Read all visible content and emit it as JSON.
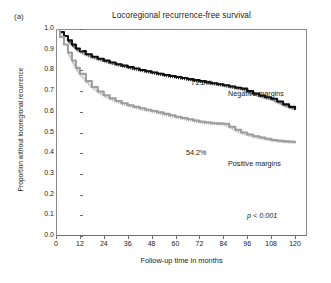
{
  "figure": {
    "panel_label": "(a)",
    "title": "Locoregional recurrence-free survival",
    "p_value": "p < 0.001"
  },
  "chart_data": {
    "type": "line",
    "title": "Locoregional recurrence-free survival",
    "xlabel": "Follow-up time in months",
    "ylabel": "Proportion without locoregional recurrence",
    "xlim": [
      0,
      126
    ],
    "ylim": [
      0.0,
      1.0
    ],
    "xticks": [
      0,
      12,
      24,
      36,
      48,
      60,
      72,
      84,
      96,
      108,
      120
    ],
    "yticks": [
      "0.0",
      "0.1",
      "0.2",
      "0.3",
      "0.4",
      "0.5",
      "0.6",
      "0.7",
      "0.8",
      "0.9",
      "1.0"
    ],
    "grid": false,
    "legend": "inline-annotations",
    "annotations": [
      {
        "text": "71.2%",
        "x": 80,
        "y": 0.755,
        "series": "Negative margins"
      },
      {
        "text": "Negative margins",
        "x": 98,
        "y": 0.7,
        "series": "Negative margins"
      },
      {
        "text": "54.2%",
        "x": 77,
        "y": 0.4,
        "series": "Positive margins"
      },
      {
        "text": "Positive margins",
        "x": 98,
        "y": 0.345,
        "series": "Positive margins"
      },
      {
        "text": "p < 0.001",
        "x": 108,
        "y": 0.12,
        "series": null
      }
    ],
    "series": [
      {
        "name": "Negative margins",
        "color": "#111111",
        "style": "step-with-censor-ticks",
        "endpoint_label": "71.2%",
        "x": [
          0,
          2,
          4,
          6,
          8,
          10,
          12,
          15,
          18,
          21,
          24,
          27,
          30,
          33,
          36,
          39,
          42,
          45,
          48,
          51,
          54,
          57,
          60,
          63,
          66,
          69,
          72,
          75,
          78,
          81,
          84,
          87,
          90,
          93,
          96,
          99,
          102,
          105,
          108,
          111,
          114,
          117,
          120
        ],
        "values": [
          1.0,
          0.985,
          0.966,
          0.945,
          0.925,
          0.906,
          0.893,
          0.878,
          0.866,
          0.856,
          0.847,
          0.838,
          0.83,
          0.823,
          0.816,
          0.809,
          0.802,
          0.796,
          0.79,
          0.784,
          0.778,
          0.773,
          0.768,
          0.763,
          0.758,
          0.753,
          0.748,
          0.743,
          0.738,
          0.733,
          0.728,
          0.722,
          0.716,
          0.712,
          0.7,
          0.688,
          0.678,
          0.67,
          0.663,
          0.65,
          0.636,
          0.624,
          0.614
        ]
      },
      {
        "name": "Positive margins",
        "color": "#9e9e9e",
        "style": "step-with-censor-ticks",
        "endpoint_label": "54.2%",
        "x": [
          0,
          2,
          4,
          6,
          8,
          10,
          12,
          15,
          18,
          21,
          24,
          27,
          30,
          33,
          36,
          39,
          42,
          45,
          48,
          51,
          54,
          57,
          60,
          63,
          66,
          69,
          72,
          75,
          78,
          81,
          84,
          87,
          90,
          93,
          96,
          99,
          102,
          105,
          108,
          111,
          114,
          117,
          120
        ],
        "values": [
          1.0,
          0.962,
          0.925,
          0.886,
          0.848,
          0.812,
          0.783,
          0.748,
          0.72,
          0.698,
          0.68,
          0.665,
          0.652,
          0.641,
          0.632,
          0.624,
          0.617,
          0.61,
          0.604,
          0.597,
          0.59,
          0.583,
          0.576,
          0.57,
          0.564,
          0.558,
          0.552,
          0.548,
          0.545,
          0.543,
          0.542,
          0.528,
          0.513,
          0.5,
          0.49,
          0.482,
          0.476,
          0.47,
          0.464,
          0.46,
          0.457,
          0.455,
          0.453
        ]
      }
    ]
  }
}
